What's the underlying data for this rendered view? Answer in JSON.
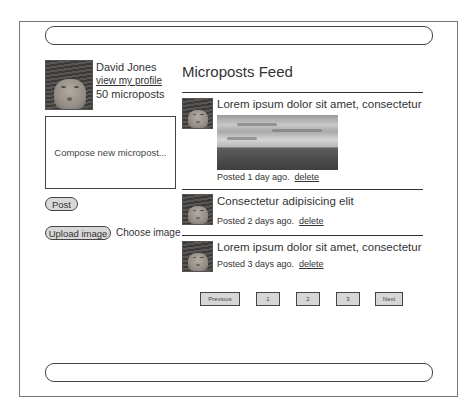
{
  "profile": {
    "name": "David Jones",
    "link_label": "view my profile",
    "count_label": "50 microposts"
  },
  "composer": {
    "placeholder": "Compose new micropost..."
  },
  "actions": {
    "post_label": "Post",
    "upload_label": "Upload image",
    "choose_label": "Choose image"
  },
  "feed": {
    "title": "Microposts Feed",
    "posts": [
      {
        "text": "Lorem ipsum dolor sit amet, consectetur",
        "meta": "Posted 1 day ago.",
        "delete_label": "delete",
        "has_image": true
      },
      {
        "text": "Consectetur adipisicing elit",
        "meta": "Posted 2 days ago.",
        "delete_label": "delete",
        "has_image": false
      },
      {
        "text": "Lorem ipsum dolor sit amet, consectetur",
        "meta": "Posted 3 days ago.",
        "delete_label": "delete",
        "has_image": false
      }
    ]
  },
  "pagination": {
    "previous": "Previous",
    "pages": [
      "1",
      "2",
      "3"
    ],
    "next": "Next"
  }
}
